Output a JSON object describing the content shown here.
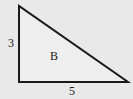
{
  "diagram": {
    "shape": "right-triangle",
    "background_color": "#e9e9e9",
    "fill_color": "#eeeeee",
    "stroke_color": "#1a1a1a",
    "vertices": [
      [
        19,
        6
      ],
      [
        19,
        82
      ],
      [
        128,
        82
      ]
    ],
    "labels": {
      "vertical_side": "3",
      "horizontal_side": "5",
      "interior": "B"
    }
  }
}
